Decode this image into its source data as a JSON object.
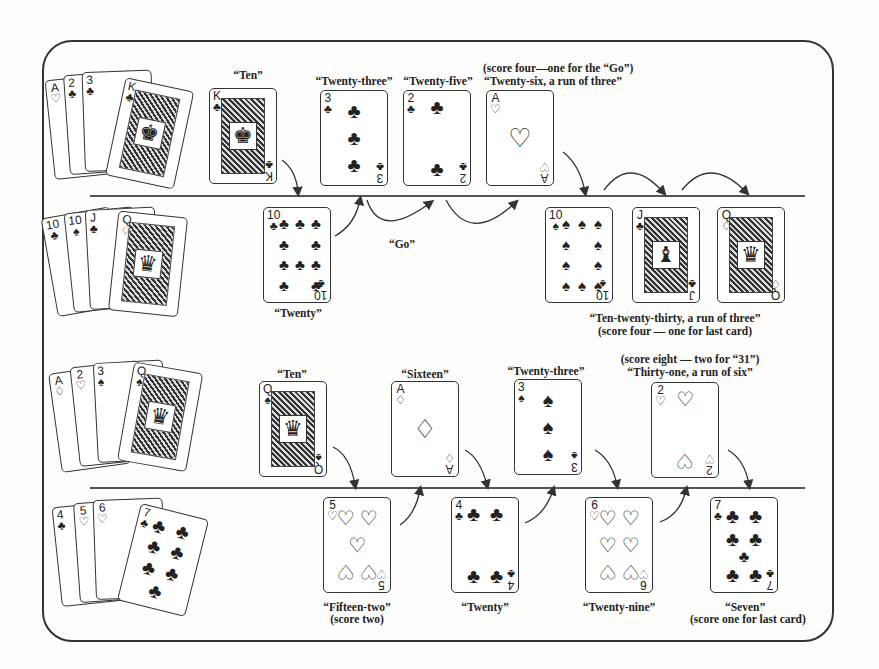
{
  "diagram": {
    "rows": [
      {
        "id": "row1",
        "player": "A",
        "hand": [
          {
            "rank": "A",
            "suit": "♡"
          },
          {
            "rank": "2",
            "suit": "♣"
          },
          {
            "rank": "3",
            "suit": "♣"
          },
          {
            "rank": "K",
            "suit": "♣"
          }
        ],
        "plays": [
          {
            "rank": "K",
            "suit": "♣",
            "label": "“Ten”"
          },
          {
            "rank": "3",
            "suit": "♣",
            "label": "“Twenty-three”"
          },
          {
            "rank": "2",
            "suit": "♣",
            "label": "“Twenty-five”"
          },
          {
            "rank": "A",
            "suit": "♡",
            "label": "“Twenty-six, a run of three”",
            "note": "(score four—one for the “Go”)"
          }
        ]
      },
      {
        "id": "row2",
        "player": "B",
        "hand": [
          {
            "rank": "10",
            "suit": "♣"
          },
          {
            "rank": "10",
            "suit": "♠"
          },
          {
            "rank": "J",
            "suit": "♣"
          },
          {
            "rank": "Q",
            "suit": "♢"
          }
        ],
        "plays": [
          {
            "rank": "10",
            "suit": "♣",
            "label": "“Twenty”"
          },
          {
            "rank": "10",
            "suit": "♠",
            "label": ""
          },
          {
            "rank": "J",
            "suit": "♣",
            "label": ""
          },
          {
            "rank": "Q",
            "suit": "♢",
            "label": ""
          }
        ],
        "go_label": "“Go”",
        "run_label": "“Ten-twenty-thirty, a run of three”",
        "run_note": "(score four — one for last card)"
      },
      {
        "id": "row3",
        "player": "A",
        "hand": [
          {
            "rank": "A",
            "suit": "♢"
          },
          {
            "rank": "2",
            "suit": "♡"
          },
          {
            "rank": "3",
            "suit": "♠"
          },
          {
            "rank": "Q",
            "suit": "♠"
          }
        ],
        "plays": [
          {
            "rank": "Q",
            "suit": "♠",
            "label": "“Ten”"
          },
          {
            "rank": "A",
            "suit": "♢",
            "label": "“Sixteen”"
          },
          {
            "rank": "3",
            "suit": "♠",
            "label": "“Twenty-three”"
          },
          {
            "rank": "2",
            "suit": "♡",
            "label": "“Thirty-one, a run of six”",
            "note": "(score eight — two for “31”)"
          }
        ]
      },
      {
        "id": "row4",
        "player": "B",
        "hand": [
          {
            "rank": "4",
            "suit": "♣"
          },
          {
            "rank": "5",
            "suit": "♡"
          },
          {
            "rank": "6",
            "suit": "♡"
          },
          {
            "rank": "7",
            "suit": "♣"
          }
        ],
        "plays": [
          {
            "rank": "5",
            "suit": "♡",
            "label": "“Fifteen-two”",
            "note": "(score two)"
          },
          {
            "rank": "4",
            "suit": "♣",
            "label": "“Twenty”"
          },
          {
            "rank": "6",
            "suit": "♡",
            "label": "“Twenty-nine”"
          },
          {
            "rank": "7",
            "suit": "♣",
            "label": "“Seven”",
            "note": "(score one for last card)"
          }
        ]
      }
    ]
  }
}
